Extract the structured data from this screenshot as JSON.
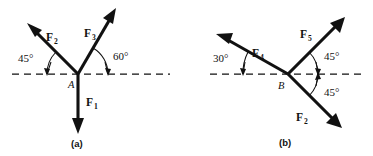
{
  "figure": {
    "background": "#ffffff",
    "ink_color": "#111111",
    "panels": [
      {
        "caption": "(a)",
        "vertex_label": "A",
        "vertex": {
          "x": 78,
          "y": 74
        },
        "axis": {
          "x1": 12,
          "x2": 170,
          "y": 74,
          "style": "dashed",
          "label": "horizontal-reference-axis"
        },
        "vectors": [
          {
            "name": "F2",
            "label": "F",
            "subscript": "2",
            "angle_deg_from_positive_x": 135,
            "direction": "up-left",
            "length": 64,
            "label_pos": {
              "x": 46,
              "y": 37
            }
          },
          {
            "name": "F3",
            "label": "F",
            "subscript": "3",
            "angle_deg_from_positive_x": 60,
            "direction": "up-right",
            "length": 64,
            "label_pos": {
              "x": 86,
              "y": 33
            }
          },
          {
            "name": "F1",
            "label": "F",
            "subscript": "1",
            "angle_deg_from_positive_x": 270,
            "direction": "down",
            "length": 50,
            "label_pos": {
              "x": 88,
              "y": 102
            }
          }
        ],
        "angles": [
          {
            "value": "45°",
            "between": [
              "F2",
              "negative-x-axis"
            ],
            "label_pos": {
              "x": 25,
              "y": 62
            }
          },
          {
            "value": "60°",
            "between": [
              "F3",
              "positive-x-axis"
            ],
            "label_pos": {
              "x": 110,
              "y": 57
            }
          }
        ]
      },
      {
        "caption": "(b)",
        "vertex_label": "B",
        "vertex": {
          "x": 288,
          "y": 74
        },
        "axis": {
          "x1": 210,
          "x2": 366,
          "y": 74,
          "style": "dashed",
          "label": "horizontal-reference-axis"
        },
        "vectors": [
          {
            "name": "F4",
            "label": "F",
            "subscript": "4",
            "angle_deg_from_positive_x": 210,
            "direction": "up-left",
            "length": 76,
            "label_pos": {
              "x": 255,
              "y": 53
            }
          },
          {
            "name": "F5",
            "label": "F",
            "subscript": "5",
            "angle_deg_from_positive_x": 45,
            "direction": "up-right",
            "length": 66,
            "label_pos": {
              "x": 303,
              "y": 34
            }
          },
          {
            "name": "F2",
            "label": "F",
            "subscript": "2",
            "angle_deg_from_positive_x": 315,
            "direction": "down-right",
            "length": 64,
            "label_pos": {
              "x": 300,
              "y": 117
            }
          }
        ],
        "angles": [
          {
            "value": "30°",
            "between": [
              "F4",
              "negative-x-axis"
            ],
            "label_pos": {
              "x": 215,
              "y": 62
            }
          },
          {
            "value": "45°",
            "between": [
              "F5",
              "positive-x-axis"
            ],
            "label_pos": {
              "x": 320,
              "y": 59
            }
          },
          {
            "value": "45°",
            "between": [
              "F2",
              "positive-x-axis"
            ],
            "label_pos": {
              "x": 322,
              "y": 93
            }
          }
        ]
      }
    ]
  }
}
